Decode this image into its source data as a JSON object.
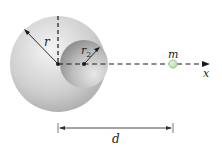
{
  "figure": {
    "sphere_radius_label": "r",
    "cavity_radius_label": "r",
    "cavity_radius_subscript": "2",
    "mass_label": "m",
    "axis_label": "x",
    "distance_label": "d"
  },
  "colors": {
    "sphere_light": "#f2f2f2",
    "sphere_dark": "#a9a9a9",
    "cavity_light": "#e6e6e6",
    "cavity_dark": "#8d8d8d",
    "mass_fill": "#bfe3b4",
    "mass_stroke": "#8cbf80",
    "line": "#1a1a1a"
  }
}
